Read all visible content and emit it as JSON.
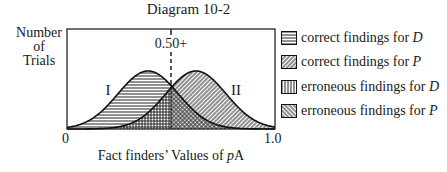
{
  "figure": {
    "title": "Diagram 10-2",
    "y_axis_label_lines": [
      "Number",
      "of",
      "Trials"
    ],
    "x_axis_label_prefix": "Fact finders’ Values of ",
    "x_axis_label_var": "p",
    "x_axis_label_suffix": "A",
    "x_tick_min": "0",
    "x_tick_max": "1.0",
    "threshold_label": "0.50+",
    "curve_labels": [
      "I",
      "II"
    ]
  },
  "legend": [
    {
      "pattern": "horizontal-lines",
      "text": "correct findings for ",
      "var": "D"
    },
    {
      "pattern": "diagonal-lines",
      "text": "correct findings for ",
      "var": "P"
    },
    {
      "pattern": "vertical-lines",
      "text": "erroneous findings for ",
      "var": "D"
    },
    {
      "pattern": "back-diagonal-lines",
      "text": "erroneous findings for ",
      "var": "P"
    }
  ],
  "chart_data": {
    "type": "area",
    "title": "Diagram 10-2",
    "xlabel": "Fact finders’ Values of pA",
    "ylabel": "Number of Trials",
    "xlim": [
      0,
      1.0
    ],
    "x_ticks": [
      "0",
      "1.0"
    ],
    "threshold": {
      "x": 0.5,
      "label": "0.50+",
      "style": "dashed"
    },
    "series": [
      {
        "name": "I",
        "shape": "normal",
        "mean": 0.39,
        "relative_height": 1.0,
        "fill_left_of_threshold": "correct findings for D",
        "fill_right_of_threshold": "erroneous findings for P"
      },
      {
        "name": "II",
        "shape": "normal",
        "mean": 0.62,
        "relative_height": 1.0,
        "fill_left_of_threshold": "erroneous findings for D",
        "fill_right_of_threshold": "correct findings for P"
      }
    ],
    "legend": [
      "correct findings for D",
      "correct findings for P",
      "erroneous findings for D",
      "erroneous findings for P"
    ],
    "legend_position": "right",
    "grid": false
  }
}
